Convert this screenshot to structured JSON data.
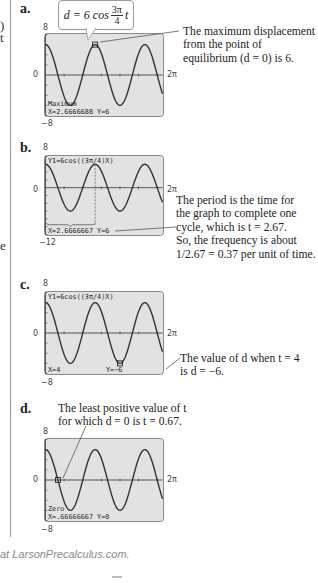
{
  "margin_fragments": [
    ")",
    "t",
    "e"
  ],
  "parts": {
    "a": {
      "label": "a.",
      "callout": {
        "lhs": "d = 6 cos",
        "num": "3π",
        "den": "4",
        "var": "t"
      },
      "ymax": "8",
      "ymin": "−8",
      "zero": "0",
      "xmax": "2π",
      "screen_line1": "Maximum",
      "screen_line2": "X=2.6666688   Y=6",
      "note": [
        "The maximum displacement",
        "from the point of",
        "equilibrium (d = 0) is 6."
      ]
    },
    "b": {
      "label": "b.",
      "ymax": "8",
      "ymin": "−12",
      "zero": "0",
      "xmax": "2π",
      "screen_top": "Y1=6cos((3π/4)X)",
      "screen_line2": "X=2.6666667   Y=6",
      "note": [
        "The period is the time for",
        "the graph to complete one",
        "cycle, which is t = 2.67.",
        "So, the frequency is about",
        "1/2.67 = 0.37 per unit of time."
      ]
    },
    "c": {
      "label": "c.",
      "ymax": "8",
      "ymin": "−8",
      "zero": "0",
      "xmax": "2π",
      "screen_top": "Y1=6cos((3π/4)X)",
      "screen_x": "X=4",
      "screen_y": "Y=−6",
      "note": [
        "The value of d when t = 4",
        "is d = −6."
      ]
    },
    "d": {
      "label": "d.",
      "ymax": "8",
      "ymin": "−8",
      "zero": "0",
      "xmax": "2π",
      "screen_line1": "Zero",
      "screen_line2": "X=.66666667   Y=0",
      "note": [
        "The least positive value of t",
        "for which d = 0 is t = 0.67."
      ]
    }
  },
  "footer": "at LarsonPrecalculus.com.",
  "chart_data": [
    {
      "type": "line",
      "title": "a. Maximum",
      "function": "6cos((3π/4)x)",
      "xlim": [
        0,
        6.2832
      ],
      "ylim": [
        -8,
        8
      ],
      "highlight": {
        "x": 2.6666688,
        "y": 6
      }
    },
    {
      "type": "line",
      "title": "b. Period",
      "function": "6cos((3π/4)x)",
      "xlim": [
        0,
        6.2832
      ],
      "ylim": [
        -12,
        8
      ],
      "highlight": {
        "x": 2.6666667,
        "y": 6
      },
      "period": 2.67,
      "frequency": 0.37
    },
    {
      "type": "line",
      "title": "c. Value at t=4",
      "function": "6cos((3π/4)x)",
      "xlim": [
        0,
        6.2832
      ],
      "ylim": [
        -8,
        8
      ],
      "highlight": {
        "x": 4,
        "y": -6
      }
    },
    {
      "type": "line",
      "title": "d. Zero",
      "function": "6cos((3π/4)x)",
      "xlim": [
        0,
        6.2832
      ],
      "ylim": [
        -8,
        8
      ],
      "highlight": {
        "x": 0.66666667,
        "y": 0
      }
    }
  ]
}
